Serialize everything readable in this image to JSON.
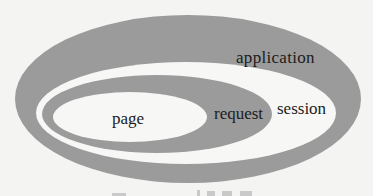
{
  "diagram": {
    "type": "nested-scope-ellipses",
    "colors": {
      "background": "#f4f4f3",
      "band_gray": "#9b9b9b",
      "band_white": "#f7f7f6",
      "text": "#1c1c1c"
    },
    "scopes": [
      {
        "id": "application",
        "label": "application",
        "fill": "gray"
      },
      {
        "id": "session",
        "label": "session",
        "fill": "white"
      },
      {
        "id": "request",
        "label": "request",
        "fill": "gray"
      },
      {
        "id": "page",
        "label": "page",
        "fill": "white"
      }
    ],
    "caption_partial": "图 …… 的作用域"
  }
}
